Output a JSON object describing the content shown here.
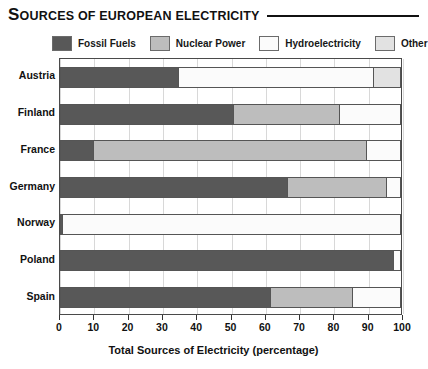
{
  "title": {
    "drop_cap": "S",
    "rest": "OURCES OF EUROPEAN ELECTRICITY"
  },
  "legend": {
    "items": [
      {
        "label": "Fossil Fuels",
        "color": "#585858",
        "key": "fossil"
      },
      {
        "label": "Nuclear Power",
        "color": "#bdbdbd",
        "key": "nuclear"
      },
      {
        "label": "Hydroelectricity",
        "color": "#fbfbfb",
        "key": "hydro"
      },
      {
        "label": "Other",
        "color": "#e2e2e2",
        "key": "other"
      }
    ]
  },
  "axis": {
    "x_title": "Total Sources of Electricity (percentage)",
    "x_ticks": [
      "0",
      "10",
      "20",
      "30",
      "40",
      "50",
      "60",
      "70",
      "80",
      "90",
      "100"
    ]
  },
  "chart_data": {
    "type": "bar",
    "orientation": "horizontal",
    "stacked": true,
    "title": "SOURCES OF EUROPEAN ELECTRICITY",
    "xlabel": "Total Sources of Electricity (percentage)",
    "ylabel": "",
    "xlim": [
      0,
      100
    ],
    "grid": true,
    "legend_position": "top",
    "categories": [
      "Austria",
      "Finland",
      "France",
      "Germany",
      "Norway",
      "Poland",
      "Spain"
    ],
    "series": [
      {
        "name": "Fossil Fuels",
        "color": "#585858",
        "values": [
          35,
          51,
          10,
          67,
          1,
          98,
          62
        ]
      },
      {
        "name": "Nuclear Power",
        "color": "#bdbdbd",
        "values": [
          0,
          31,
          80,
          29,
          0,
          0,
          24
        ]
      },
      {
        "name": "Hydroelectricity",
        "color": "#fbfbfb",
        "values": [
          57,
          18,
          10,
          4,
          99,
          2,
          14
        ]
      },
      {
        "name": "Other",
        "color": "#e2e2e2",
        "values": [
          8,
          0,
          0,
          0,
          0,
          0,
          0
        ]
      }
    ]
  }
}
